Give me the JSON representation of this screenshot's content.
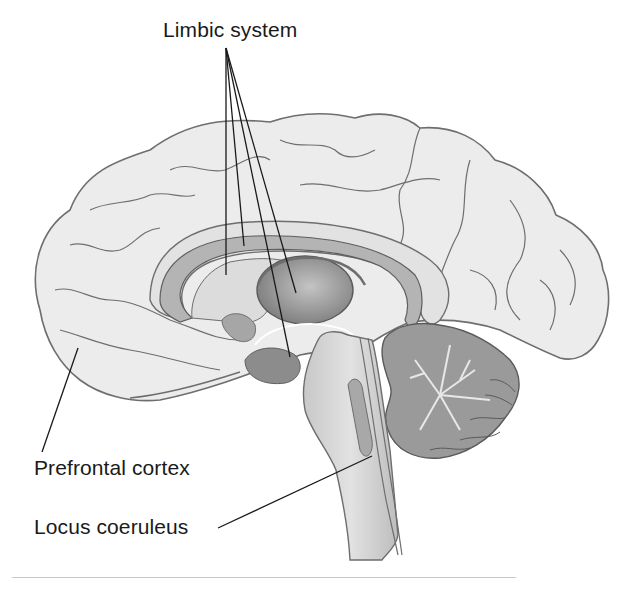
{
  "figure": {
    "type": "anatomical-diagram",
    "rendering": "grayscale illustration"
  },
  "labels": {
    "limbic_system": "Limbic system",
    "prefrontal_cortex": "Prefrontal cortex",
    "locus_coeruleus": "Locus coeruleus"
  },
  "callouts": [
    {
      "label": "Limbic system",
      "origin": [
        226,
        48
      ],
      "targets": [
        [
          226,
          275
        ],
        [
          244,
          246
        ],
        [
          290,
          357
        ],
        [
          296,
          293
        ]
      ]
    },
    {
      "label": "Prefrontal cortex",
      "origin": [
        42,
        452
      ],
      "targets": [
        [
          78,
          348
        ]
      ]
    },
    {
      "label": "Locus coeruleus",
      "origin": [
        218,
        528
      ],
      "targets": [
        [
          372,
          456
        ]
      ]
    }
  ],
  "colors": {
    "background": "#ffffff",
    "cortex_fill": "#ececec",
    "outline": "#6e6e6e",
    "limbic_fill": "#b4b4b4",
    "thalamus_fill": "#8e8e8e",
    "cerebellum_fill": "#9a9a9a",
    "leader_line": "#1a1a1a"
  }
}
